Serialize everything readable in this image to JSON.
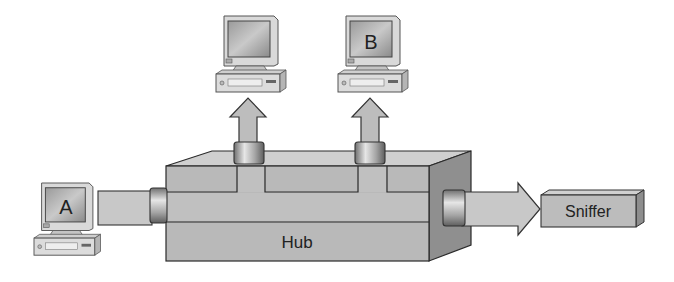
{
  "diagram": {
    "hub": {
      "label": "Hub"
    },
    "sniffer": {
      "label": "Sniffer"
    },
    "computers": [
      {
        "id": "A",
        "label": "A"
      },
      {
        "id": "unlabeled",
        "label": ""
      },
      {
        "id": "B",
        "label": "B"
      }
    ]
  },
  "colors": {
    "hub_front": "#b9b9b9",
    "hub_top": "#cfcfcf",
    "hub_side": "#8f8f8f",
    "pipe": "#c8c8c8",
    "arrow": "#bdbdbd",
    "outline": "#2a2a2a"
  }
}
